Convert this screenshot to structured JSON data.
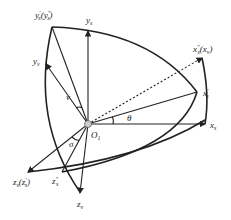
{
  "diagram": {
    "type": "coordinate-frame-rotation",
    "origin": {
      "label": "O",
      "sub": "1"
    },
    "axes": {
      "ys": {
        "label": "y",
        "sub": "s"
      },
      "yprime": {
        "label": "y",
        "sub": "s",
        "sup": "′",
        "paren": "(y",
        "paren_sub": "s",
        "paren_sup": "″",
        "close": ")"
      },
      "yv": {
        "label": "y",
        "sub": "v"
      },
      "xdouble": {
        "label": "x",
        "sub": "s",
        "sup": "″",
        "paren": "(x",
        "paren_sub": "v",
        "close": ")"
      },
      "xprime": {
        "label": "x",
        "sub": "s",
        "sup": "′"
      },
      "xs": {
        "label": "x",
        "sub": "s"
      },
      "zs": {
        "label": "z",
        "sub": "s",
        "paren": "(z",
        "paren_sub": "s",
        "paren_sup": "′",
        "close": ")"
      },
      "zdouble": {
        "label": "z",
        "sub": "s",
        "sup": "″"
      },
      "zv": {
        "label": "z",
        "sub": "v"
      }
    },
    "angles": {
      "theta": "θ",
      "nu": "ν",
      "sigma": "σ"
    },
    "colors": {
      "line": "#222222",
      "origin_fill": "#cccccc"
    }
  }
}
